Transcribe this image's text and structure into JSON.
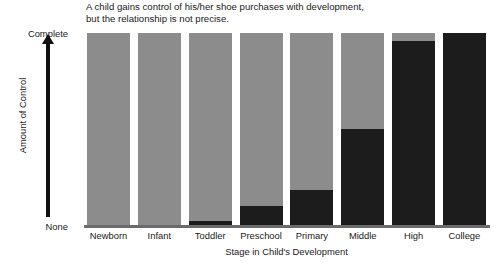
{
  "chart_data": {
    "type": "bar",
    "title": "A child gains control of his/her shoe purchases with development,\nbut the relationship is not precise.",
    "xlabel": "Stage in Child's Development",
    "ylabel": "Amount of Control",
    "ylim": [
      0,
      100
    ],
    "ytick_labels": [
      "None",
      "Complete"
    ],
    "grid": false,
    "legend": "none",
    "stacked": true,
    "categories": [
      "Newborn",
      "Infant",
      "Toddler",
      "Preschool",
      "Primary",
      "Middle",
      "High",
      "College"
    ],
    "series": [
      {
        "name": "Child control",
        "color": "#1c1c1c",
        "values": [
          0,
          0,
          2,
          10,
          18,
          50,
          96,
          100
        ]
      },
      {
        "name": "Parent control",
        "color": "#8c8c8c",
        "values": [
          100,
          100,
          98,
          90,
          82,
          50,
          4,
          0
        ]
      }
    ]
  },
  "colors": {
    "dark_segment": "#1c1c1c",
    "light_segment": "#8c8c8c",
    "axis": "#6b6b6b",
    "text": "#1a1a1a",
    "background": "#ffffff"
  }
}
